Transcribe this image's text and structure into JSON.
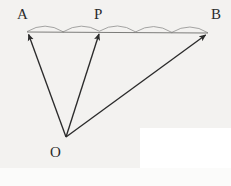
{
  "figure": {
    "kind": "geometry-vector-diagram",
    "width": 231,
    "height": 186,
    "background_color": "#f3f2f0",
    "page_color": "#ffffff",
    "ink_color": "#2b2b2b",
    "arc_color": "#9a9a98",
    "segment_color": "#6e6e6c"
  },
  "labels": {
    "a": "A",
    "p": "P",
    "b": "B",
    "o": "O"
  },
  "points": {
    "A": {
      "name": "A",
      "x": 27,
      "y": 32
    },
    "P": {
      "name": "P",
      "x": 100,
      "y": 31
    },
    "B": {
      "name": "B",
      "x": 208,
      "y": 33
    },
    "O": {
      "name": "O",
      "x": 66,
      "y": 137
    }
  },
  "vectors": [
    {
      "name": "vector-OA",
      "from": "O",
      "to": "A",
      "arrowhead_at": "A"
    },
    {
      "name": "vector-OP",
      "from": "O",
      "to": "P",
      "arrowhead_at": "P"
    },
    {
      "name": "vector-OB",
      "from": "O",
      "to": "B",
      "arrowhead_at": "B"
    }
  ],
  "segment": {
    "name": "segment-AB",
    "from": "A",
    "to": "B",
    "divisions": 5,
    "arcs_from_A_to_P": 2,
    "arcs_from_P_to_B": 3,
    "division_points_x": [
      27,
      63.2,
      99.4,
      135.6,
      171.8,
      208
    ],
    "division_points_y": [
      32.0,
      32.2,
      31.4,
      32.2,
      32.6,
      33.0
    ],
    "tick_marks_at": [
      "A",
      "P",
      "B"
    ]
  },
  "arcs": [
    {
      "name": "arc-1",
      "span": "A-to-d1",
      "x1": 27,
      "x2": 63.2,
      "rise": 10
    },
    {
      "name": "arc-2",
      "span": "d1-to-P",
      "x1": 63.2,
      "x2": 99.4,
      "rise": 10
    },
    {
      "name": "arc-3",
      "span": "P-to-d3",
      "x1": 99.4,
      "x2": 135.6,
      "rise": 10
    },
    {
      "name": "arc-4",
      "span": "d3-to-d4",
      "x1": 135.6,
      "x2": 171.8,
      "rise": 10
    },
    {
      "name": "arc-5",
      "span": "d4-to-B",
      "x1": 171.8,
      "x2": 208,
      "rise": 10
    }
  ]
}
